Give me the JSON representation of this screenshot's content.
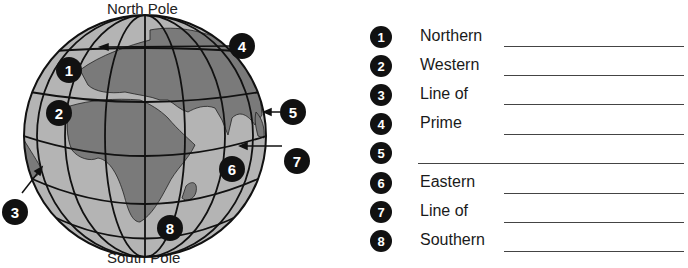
{
  "globe": {
    "north_label": "North Pole",
    "south_label": "South Pole",
    "callouts": [
      {
        "n": "1",
        "x": 56,
        "y": 57
      },
      {
        "n": "2",
        "x": 46,
        "y": 100
      },
      {
        "n": "3",
        "x": 2,
        "y": 199
      },
      {
        "n": "4",
        "x": 229,
        "y": 33
      },
      {
        "n": "5",
        "x": 280,
        "y": 99
      },
      {
        "n": "6",
        "x": 219,
        "y": 156
      },
      {
        "n": "7",
        "x": 284,
        "y": 148
      },
      {
        "n": "8",
        "x": 157,
        "y": 215
      }
    ],
    "colors": {
      "ocean": "#b4b4b4",
      "land": "#7a7a7a",
      "lines": "#111111",
      "callout": "#111111"
    }
  },
  "worksheet": {
    "items": [
      {
        "n": "1",
        "term": "Northern"
      },
      {
        "n": "2",
        "term": "Western"
      },
      {
        "n": "3",
        "term": "Line of"
      },
      {
        "n": "4",
        "term": "Prime"
      },
      {
        "n": "5",
        "term": ""
      },
      {
        "n": "6",
        "term": "Eastern"
      },
      {
        "n": "7",
        "term": "Line of"
      },
      {
        "n": "8",
        "term": "Southern"
      }
    ]
  }
}
